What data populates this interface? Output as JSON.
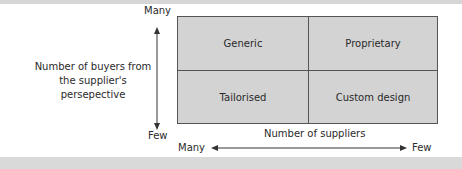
{
  "diagram": {
    "cells": [
      {
        "label": "Generic"
      },
      {
        "label": "Proprietary"
      },
      {
        "label": "Tailorised"
      },
      {
        "label": "Custom design"
      }
    ],
    "y_axis": {
      "title_line1": "Number of buyers from",
      "title_line2": "the supplier's persepective",
      "top_label": "Many",
      "bottom_label": "Few"
    },
    "x_axis": {
      "title": "Number of suppliers",
      "left_label": "Many",
      "right_label": "Few"
    },
    "colors": {
      "cell_fill": "#d3d3d3",
      "border": "#555555",
      "bars": "#d6d6d6"
    }
  }
}
